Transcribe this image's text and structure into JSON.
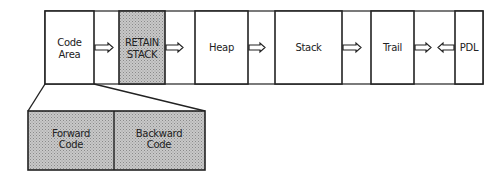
{
  "diagram": {
    "memory_areas": [
      {
        "id": "code-area",
        "line1": "Code",
        "line2": "Area",
        "shaded": false
      },
      {
        "id": "retain-stack",
        "line1": "RETAIN",
        "line2": "STACK",
        "shaded": true
      },
      {
        "id": "heap",
        "line1": "Heap",
        "line2": "",
        "shaded": false
      },
      {
        "id": "stack",
        "line1": "Stack",
        "line2": "",
        "shaded": false
      },
      {
        "id": "trail",
        "line1": "Trail",
        "line2": "",
        "shaded": false
      },
      {
        "id": "pdl",
        "line1": "PDL",
        "line2": "",
        "shaded": false
      }
    ],
    "arrows": [
      {
        "from": "code-area",
        "direction": "right"
      },
      {
        "from": "retain-stack",
        "direction": "right"
      },
      {
        "from": "heap",
        "direction": "right"
      },
      {
        "from": "stack",
        "direction": "right"
      },
      {
        "from": "trail",
        "direction": "right"
      },
      {
        "from": "pdl",
        "direction": "left"
      }
    ],
    "code_area_detail": {
      "forward": {
        "line1": "Forward",
        "line2": "Code"
      },
      "backward": {
        "line1": "Backward",
        "line2": "Code"
      }
    },
    "colors": {
      "stroke": "#222222",
      "shade": "#b4b4b4",
      "background": "#ffffff"
    }
  }
}
